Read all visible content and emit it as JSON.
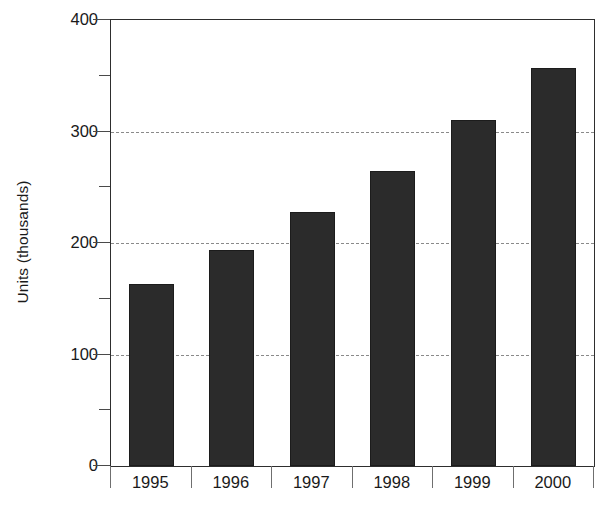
{
  "chart_data": {
    "type": "bar",
    "title": "",
    "subtitle": "",
    "xlabel": "",
    "ylabel": "Units (thousands)",
    "categories": [
      "1995",
      "1996",
      "1997",
      "1998",
      "1999",
      "2000"
    ],
    "values": [
      163,
      194,
      228,
      265,
      310,
      357
    ],
    "ylim": [
      0,
      400
    ],
    "y_major_ticks": [
      0,
      100,
      200,
      300,
      400
    ],
    "y_minor_ticks": [
      50,
      150,
      250,
      350
    ],
    "y_tick_labels": [
      "0",
      "100",
      "200",
      "300",
      "400"
    ],
    "gridlines": {
      "y_values": [
        100,
        200,
        300
      ],
      "style": "dashed",
      "color": "#8a8a8a",
      "x_grid": false
    },
    "legend": null,
    "legend_position": "none",
    "series": [
      {
        "name": "Units",
        "values": [
          163,
          194,
          228,
          265,
          310,
          357
        ],
        "color": "#2b2b2b"
      }
    ],
    "annotations": []
  },
  "axes": {
    "y_title": "Units (thousands)",
    "y_labels": [
      {
        "text": "400",
        "value": 400
      },
      {
        "text": "300",
        "value": 300
      },
      {
        "text": "200",
        "value": 200
      },
      {
        "text": "100",
        "value": 100
      },
      {
        "text": "0",
        "value": 0
      }
    ],
    "x_labels": [
      "1995",
      "1996",
      "1997",
      "1998",
      "1999",
      "2000"
    ]
  },
  "colors": {
    "bar_fill": "#2b2b2b",
    "bar_stroke": "#1c1c1c",
    "gridline": "#8a8a8a",
    "axis": "#2e2e2e",
    "text": "#1a1a1a",
    "background": "#ffffff"
  }
}
